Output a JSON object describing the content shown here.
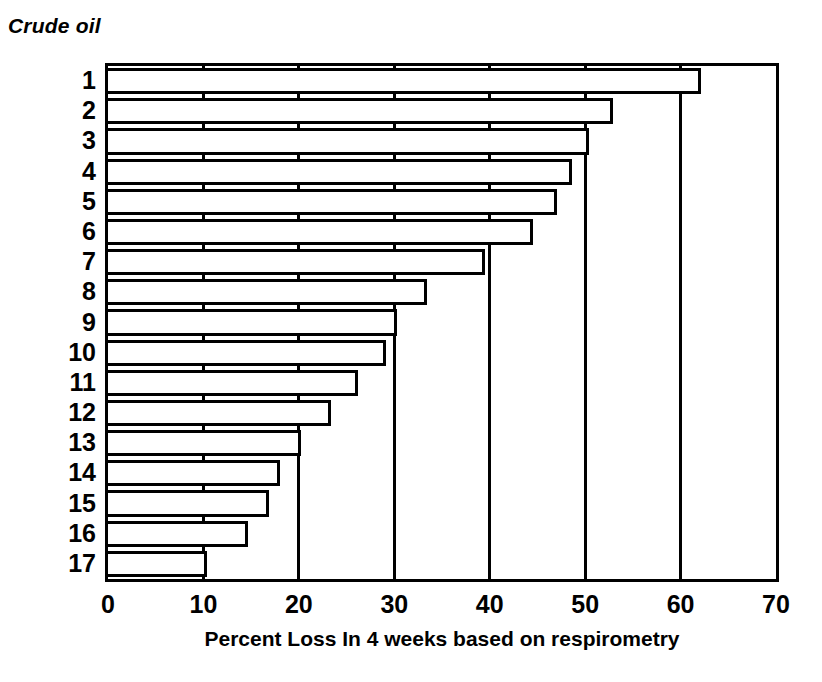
{
  "chart_data": {
    "type": "bar",
    "orientation": "horizontal",
    "title": "Crude oil",
    "xlabel": "Percent Loss In 4 weeks based on respirometry",
    "ylabel": "",
    "xlim": [
      0,
      70
    ],
    "xticks": [
      0,
      10,
      20,
      30,
      40,
      50,
      60,
      70
    ],
    "xtick_labels": [
      "0",
      "10",
      "20",
      "30",
      "40",
      "50",
      "60",
      "70"
    ],
    "grid": true,
    "grid_axis": "x",
    "legend": false,
    "categories": [
      "1",
      "2",
      "3",
      "4",
      "5",
      "6",
      "7",
      "8",
      "9",
      "10",
      "11",
      "12",
      "13",
      "14",
      "15",
      "16",
      "17"
    ],
    "values": [
      62.1,
      52.9,
      50.4,
      48.6,
      47.0,
      44.5,
      39.5,
      33.4,
      30.3,
      29.1,
      26.2,
      23.4,
      20.2,
      18.0,
      16.9,
      14.7,
      10.4
    ],
    "bar_facecolor": "#ffffff",
    "bar_edgecolor": "#000000",
    "axes_color": "#000000",
    "background": "#ffffff"
  }
}
